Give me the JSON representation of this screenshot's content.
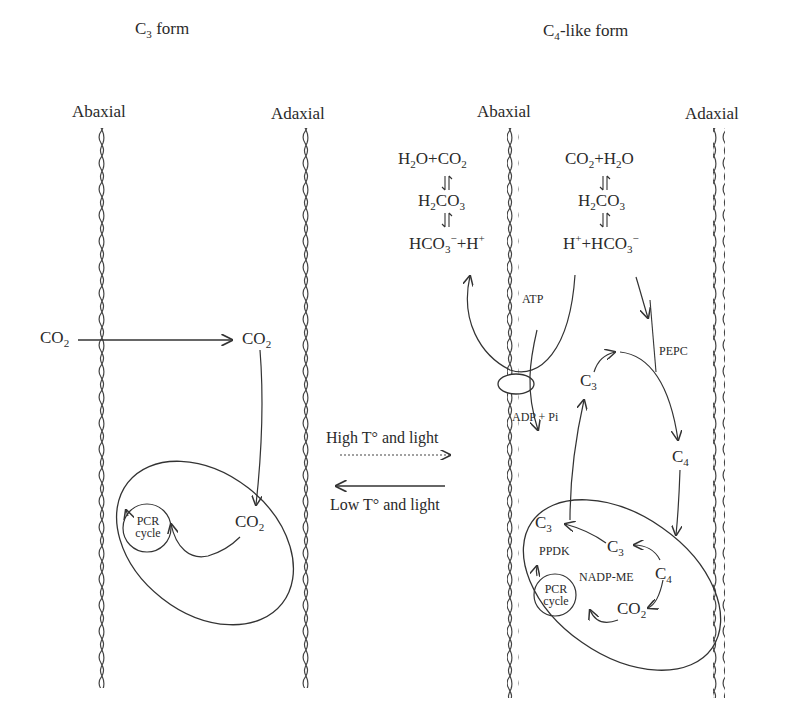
{
  "figure": {
    "left_panel": {
      "title": {
        "main": "C",
        "sub": "3",
        "rest": " form"
      },
      "abaxial_label": "Abaxial",
      "adaxial_label": "Adaxial",
      "co2_outside": {
        "main": "CO",
        "sub": "2"
      },
      "co2_inside": {
        "main": "CO",
        "sub": "2"
      },
      "co2_chloroplast": {
        "main": "CO",
        "sub": "2"
      },
      "pcr_cycle": {
        "line1": "PCR",
        "line2": "cycle"
      }
    },
    "conditions": {
      "forward": "High T° and light",
      "reverse": "Low T° and light"
    },
    "right_panel": {
      "title": {
        "main": "C",
        "sub": "4",
        "rest": "-like form"
      },
      "abaxial_label": "Abaxial",
      "adaxial_label": "Adaxial",
      "left_equilibrium": {
        "row1": {
          "a": "H",
          "a_sub": "2",
          "b": "O+CO",
          "b_sub": "2"
        },
        "row2": {
          "a": "H",
          "a_sub": "2",
          "b": "CO",
          "b_sub": "3"
        },
        "row3": {
          "a": "HCO",
          "a_sub": "3",
          "a_sup": "−",
          "b": "+H",
          "b_sup": "+"
        }
      },
      "right_equilibrium": {
        "row1": {
          "a": "CO",
          "a_sub": "2",
          "b": "+H",
          "b_sub": "2",
          "c": "O"
        },
        "row2": {
          "a": "H",
          "a_sub": "2",
          "b": "CO",
          "b_sub": "3"
        },
        "row3": {
          "a": "H",
          "a_sup": "+",
          "b": "+HCO",
          "b_sub": "3",
          "b_sup": "−"
        }
      },
      "atp": "ATP",
      "adp_pi": "ADP + Pi",
      "pepc": "PEPC",
      "c3_cytosol": {
        "main": "C",
        "sub": "3"
      },
      "c4_cytosol": {
        "main": "C",
        "sub": "4"
      },
      "chloroplast": {
        "c3_left": {
          "main": "C",
          "sub": "3"
        },
        "c3_mid": {
          "main": "C",
          "sub": "3"
        },
        "c4": {
          "main": "C",
          "sub": "4"
        },
        "co2": {
          "main": "CO",
          "sub": "2"
        },
        "ppdk": "PPDK",
        "nadp_me": "NADP-ME",
        "pcr_cycle": {
          "line1": "PCR",
          "line2": "cycle"
        }
      }
    }
  }
}
